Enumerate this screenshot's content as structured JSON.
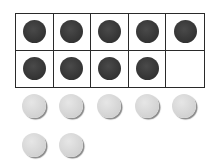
{
  "ten_frame": {
    "rows": 2,
    "columns": 5,
    "filled_count": 9,
    "cells": [
      [
        true,
        true,
        true,
        true,
        true
      ],
      [
        true,
        true,
        true,
        true,
        false
      ]
    ],
    "counter_color": "#3a3a3a",
    "border_color": "#2a2a2a"
  },
  "loose_counters": {
    "count": 7,
    "color": "#d9d9d9",
    "rows": [
      5,
      2
    ]
  }
}
